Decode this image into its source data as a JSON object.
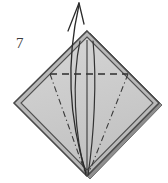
{
  "figure": {
    "kind": "origami-fold-diagram",
    "step_number": "7",
    "caption": "",
    "canvas": {
      "width": 168,
      "height": 183
    }
  },
  "colors": {
    "paper_fill": "#c9c9c9",
    "paper_fill_light": "#d4d4d4",
    "paper_edge_dark": "#4a4a4a",
    "paper_edge_outer": "#6e6e6e",
    "shadow_edge": "#555555",
    "fold_line": "#2e2e2e",
    "crease_line": "#3a3a3a",
    "arrow_stroke": "#2b2b2b",
    "label_text": "#3c3c3c",
    "background": "#ffffff"
  },
  "shapes": {
    "paper": {
      "name": "diamond-paper",
      "vertices": {
        "top": [
          87,
          31
        ],
        "right": [
          159,
          103
        ],
        "bottom": [
          87,
          176
        ],
        "left": [
          14,
          103
        ]
      }
    },
    "inner_paper": {
      "name": "inner-diamond-face",
      "vertices": {
        "top": [
          87,
          36
        ],
        "right": [
          154,
          103
        ],
        "bottom": [
          87,
          171
        ],
        "left": [
          19,
          103
        ]
      }
    }
  },
  "lines": {
    "valley_fold": {
      "label": "horizontal dashed fold line",
      "style": "dashed",
      "from": [
        50,
        74
      ],
      "to": [
        128,
        74
      ]
    },
    "crease_left": {
      "label": "left dash-dot crease",
      "style": "dash-dot",
      "from": [
        50,
        74
      ],
      "to": [
        86,
        175
      ]
    },
    "crease_right": {
      "label": "right dash-dot crease",
      "style": "dash-dot",
      "from": [
        128,
        74
      ],
      "to": [
        88,
        175
      ]
    },
    "center_line": {
      "label": "vertical center line",
      "style": "solid",
      "from": [
        87,
        40
      ],
      "to": [
        87,
        174
      ]
    },
    "petal_left": {
      "label": "left solid curved edge",
      "style": "solid-curve",
      "path": "M 80,41 C 72,78 74,135 86,175"
    },
    "petal_right": {
      "label": "right solid curved edge",
      "style": "solid-curve",
      "path": "M 93,41 C 97,80 94,136 88,175"
    }
  },
  "arrow": {
    "name": "fold-direction-arrow",
    "description": "curved arrow pointing up and out from the top of the model",
    "path": "M 86,172 C 70,120 66,66 79,6",
    "tip": [
      79,
      3
    ],
    "head": {
      "left_barb": [
        68,
        30
      ],
      "right_barb": [
        84,
        23
      ]
    }
  }
}
